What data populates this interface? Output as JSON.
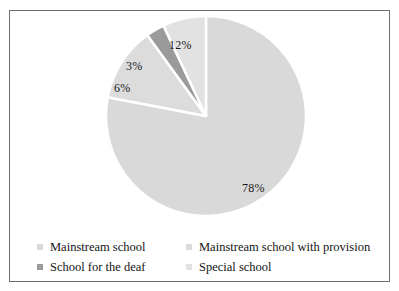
{
  "chart_data": {
    "type": "pie",
    "title": "",
    "subtitle": "",
    "xlabel": "",
    "ylabel": "",
    "grid": false,
    "legend_position": "bottom",
    "start_angle_deg": 0,
    "direction": "clockwise",
    "categories": [
      "Mainstream school",
      "Mainstream school with provision",
      "School for the deaf",
      "Special school"
    ],
    "values": [
      78,
      12,
      3,
      6
    ],
    "unit": "%",
    "data_labels": [
      "78%",
      "12%",
      "3%",
      "6%"
    ],
    "colors": [
      "#d9d9d9",
      "#dcdcdc",
      "#9b9b9b",
      "#e2e2e2"
    ],
    "slice_border_color": "#ffffff",
    "slices": [
      {
        "label": "Mainstream school",
        "value": 78,
        "data_label": "78%",
        "color": "#d9d9d9",
        "start_deg": 0,
        "end_deg": 280.8
      },
      {
        "label": "Mainstream school with provision",
        "value": 12,
        "data_label": "12%",
        "color": "#dcdcdc",
        "start_deg": 280.8,
        "end_deg": 324
      },
      {
        "label": "School for the deaf",
        "value": 3,
        "data_label": "3%",
        "color": "#9b9b9b",
        "start_deg": 324,
        "end_deg": 334.8
      },
      {
        "label": "Special school",
        "value": 6,
        "data_label": "6%",
        "color": "#e2e2e2",
        "start_deg": 334.8,
        "end_deg": 360
      }
    ]
  },
  "figure": {
    "border_color": "#6f6f6f",
    "background": "#ffffff"
  },
  "labels": {
    "pct_78": "78%",
    "pct_12": "12%",
    "pct_3": "3%",
    "pct_6": "6%"
  },
  "legend": {
    "entries": [
      {
        "label": "Mainstream school",
        "color": "#d9d9d9"
      },
      {
        "label": "Mainstream school with provision",
        "color": "#dcdcdc"
      },
      {
        "label": "School for the deaf",
        "color": "#9b9b9b"
      },
      {
        "label": "Special school",
        "color": "#e2e2e2"
      }
    ]
  }
}
